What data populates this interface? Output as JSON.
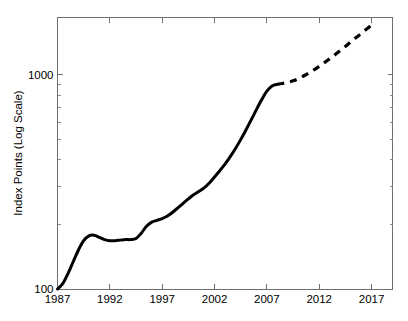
{
  "chart_data": {
    "type": "line",
    "title": "",
    "xlabel": "",
    "ylabel": "Index Points (Log Scale)",
    "yscale": "log",
    "ylim": [
      100,
      2000
    ],
    "xlim": [
      1987,
      2019
    ],
    "grid": false,
    "legend": null,
    "y_tick_labels": [
      "1000",
      "100"
    ],
    "y_ticks": [
      1000,
      100
    ],
    "x_ticks": [
      1987,
      1992,
      1997,
      2002,
      2007,
      2012,
      2017
    ],
    "x_tick_labels": [
      "1987",
      "1992",
      "1997",
      "2002",
      "2007",
      "2012",
      "2017"
    ],
    "line_color": "#000000",
    "axis_color": "#6e6e6e",
    "series": [
      {
        "name": "historical",
        "style": "solid",
        "x": [
          1987,
          1987.5,
          1988,
          1988.5,
          1989,
          1989.5,
          1990,
          1990.5,
          1991,
          1991.5,
          1992,
          1992.5,
          1993,
          1993.5,
          1994,
          1994.5,
          1995,
          1995.5,
          1996,
          1996.5,
          1997,
          1997.5,
          1998,
          1998.5,
          1999,
          1999.5,
          2000,
          2000.5,
          2001,
          2001.5,
          2002,
          2002.5,
          2003,
          2003.5,
          2004,
          2004.5,
          2005,
          2005.5,
          2006,
          2006.5,
          2007,
          2007.5,
          2008
        ],
        "values": [
          100,
          106,
          118,
          134,
          152,
          168,
          177,
          178,
          174,
          170,
          168,
          168,
          169,
          170,
          170,
          172,
          182,
          196,
          205,
          209,
          213,
          219,
          228,
          239,
          251,
          263,
          275,
          285,
          296,
          312,
          333,
          356,
          382,
          414,
          452,
          497,
          551,
          614,
          686,
          762,
          836,
          884,
          900
        ]
      },
      {
        "name": "forecast",
        "style": "dashed",
        "x": [
          2008,
          2008.5,
          2009,
          2009.5,
          2010,
          2010.5,
          2011,
          2011.5,
          2012,
          2012.5,
          2013,
          2013.5,
          2014,
          2014.5,
          2015,
          2015.5,
          2016,
          2016.5,
          2017
        ],
        "values": [
          900,
          908,
          918,
          934,
          956,
          984,
          1016,
          1052,
          1092,
          1136,
          1184,
          1236,
          1292,
          1352,
          1416,
          1482,
          1552,
          1624,
          1700
        ]
      }
    ]
  }
}
